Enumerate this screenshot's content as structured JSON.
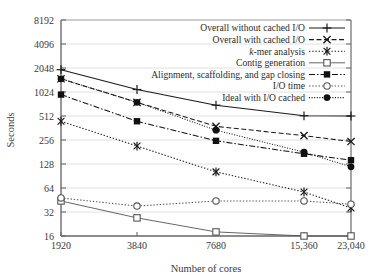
{
  "chart_data": {
    "type": "line",
    "title": "",
    "xlabel": "Number of cores",
    "ylabel": "Seconds",
    "x": [
      1920,
      3840,
      7680,
      15360,
      23040
    ],
    "xtick_labels": [
      "1920",
      "3840",
      "7680",
      "15,360",
      "23,040"
    ],
    "yscale": "log2",
    "ylim": [
      16,
      8192
    ],
    "ytick_values": [
      16,
      32,
      64,
      128,
      256,
      512,
      1024,
      2048,
      4096,
      8192
    ],
    "ytick_labels": [
      "16",
      "32",
      "64",
      "128",
      "256",
      "512",
      "1024",
      "2048",
      "4096",
      "8192"
    ],
    "grid": true,
    "legend_position": "top-right-inside",
    "series": [
      {
        "name": "Overall without cached I/O",
        "label": "Overall without cached I/O",
        "marker": "plus",
        "linestyle": "solid",
        "color": "#1a1a1a",
        "values": [
          1950,
          1100,
          700,
          515,
          512
        ]
      },
      {
        "name": "Overall with cached I/O",
        "label": "Overall with cached I/O",
        "marker": "cross",
        "linestyle": "dashed",
        "color": "#1a1a1a",
        "values": [
          1500,
          760,
          380,
          290,
          245
        ]
      },
      {
        "name": "k-mer analysis",
        "label_italic_prefix": "k",
        "label_rest": "-mer analysis",
        "label": "k-mer analysis",
        "marker": "asterisk",
        "linestyle": "dotted",
        "color": "#1a1a1a",
        "values": [
          440,
          215,
          102,
          57,
          36
        ]
      },
      {
        "name": "Contig generation",
        "label": "Contig generation",
        "marker": "open-square",
        "linestyle": "solid-light",
        "color": "#555555",
        "values": [
          44,
          27,
          18,
          16,
          16
        ]
      },
      {
        "name": "Alignment, scaffolding, and gap closing",
        "label": "Alignment, scaffolding, and gap closing",
        "marker": "filled-square",
        "linestyle": "dashdot",
        "color": "#111111",
        "values": [
          950,
          440,
          250,
          172,
          143
        ]
      },
      {
        "name": "I/O time",
        "label": "I/O time",
        "marker": "open-circle",
        "linestyle": "dotted",
        "color": "#555555",
        "values": [
          48,
          38,
          44,
          44,
          40
        ]
      },
      {
        "name": "Ideal with I/O cached",
        "label": "Ideal with I/O cached",
        "marker": "filled-circle",
        "linestyle": "dotted-dense",
        "color": "#111111",
        "values": [
          1500,
          760,
          340,
          180,
          118
        ]
      }
    ]
  }
}
